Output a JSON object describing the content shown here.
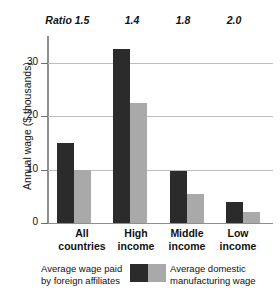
{
  "chart_data": {
    "type": "bar",
    "title": "",
    "xlabel": "",
    "ylabel": "Annual wage ($ thousands)",
    "ylim": [
      0,
      35
    ],
    "yticks": [
      0,
      10,
      20,
      30
    ],
    "ytick_labels": [
      "0",
      "10",
      "20",
      "30"
    ],
    "grid": true,
    "legend_position": "bottom",
    "categories": [
      "All countries",
      "High income",
      "Middle income",
      "Low income"
    ],
    "category_lines": [
      [
        "All",
        "countries"
      ],
      [
        "High",
        "income"
      ],
      [
        "Middle",
        "income"
      ],
      [
        "Low",
        "income"
      ]
    ],
    "series": [
      {
        "name": "Average wage paid by foreign affiliates",
        "name_lines": [
          "Average wage paid",
          "by foreign affiliates"
        ],
        "color": "#2b2b2b",
        "values": [
          15.0,
          32.5,
          9.8,
          4.0
        ]
      },
      {
        "name": "Average domestic manufacturing wage",
        "name_lines": [
          "Average domestic",
          "manufacturing wage"
        ],
        "color": "#a9a9a9",
        "values": [
          10.0,
          22.5,
          5.5,
          2.0
        ]
      }
    ],
    "annotations": {
      "row_label": "Ratio",
      "row_values": [
        "1.5",
        "1.4",
        "1.8",
        "2.0"
      ]
    }
  },
  "colors": {
    "bar_dark": "#2b2b2b",
    "bar_light": "#a9a9a9",
    "gridline": "#bdbdbd",
    "axis": "#8e8e8e",
    "text": "#111111",
    "background": "#ffffff"
  }
}
